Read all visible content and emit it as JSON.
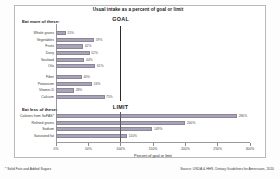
{
  "chart_data": {
    "type": "bar",
    "orientation": "horizontal",
    "title": "Usual intake as a percent of goal or limit",
    "xlabel": "Percent of goal or limit",
    "ylabel": "",
    "xlim": [
      0,
      300
    ],
    "xticks": [
      "0%",
      "50%",
      "100%",
      "150%",
      "200%",
      "250%",
      "300%"
    ],
    "xtick_values": [
      0,
      50,
      100,
      150,
      200,
      250,
      300
    ],
    "grid": false,
    "legend": "none",
    "groups": [
      {
        "heading": "Eat more of these:",
        "marker_label": "GOAL",
        "marker_value": 100,
        "categories": [
          "Whole grains",
          "Vegetables",
          "Fruits",
          "Dairy",
          "Seafood",
          "Oils",
          "Fiber",
          "Potassium",
          "Vitamin D",
          "Calcium"
        ],
        "values": [
          15,
          59,
          42,
          52,
          44,
          61,
          40,
          56,
          28,
          75
        ],
        "value_labels": [
          "15%",
          "59%",
          "42%",
          "52%",
          "44%",
          "61%",
          "40%",
          "56%",
          "28%",
          "75%"
        ]
      },
      {
        "heading": "Eat less of these:",
        "marker_label": "LIMIT",
        "marker_value": 100,
        "categories": [
          "Calories from SoFAS*",
          "Refined grains",
          "Sodium",
          "Saturated fat"
        ],
        "values": [
          280,
          200,
          149,
          110
        ],
        "value_labels": [
          "280%",
          "200%",
          "149%",
          "110%"
        ]
      }
    ],
    "annotations": {
      "footnote": "* Solid Fats and Added Sugars",
      "source": "Source: USDA & HHS. Dietary Guidelines for Americans, 2010"
    },
    "colors": {
      "bar": "#a9a3b8",
      "marker": "#2b2b2b",
      "axis": "#9a9a9a",
      "text": "#231f20"
    }
  }
}
